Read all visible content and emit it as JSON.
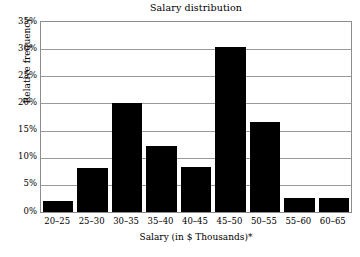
{
  "chart_data": {
    "type": "bar",
    "title": "Salary distribution",
    "xlabel": "Salary (in $ Thousands)*",
    "ylabel": "Relative frequency",
    "categories": [
      "20–25",
      "25–30",
      "30–35",
      "35–40",
      "40–45",
      "45–50",
      "50–55",
      "55–60",
      "60–65"
    ],
    "values": [
      2.1,
      8.1,
      20.1,
      12.2,
      8.3,
      30.4,
      16.5,
      2.5,
      2.6
    ],
    "ylim": [
      0,
      35
    ],
    "y_ticks": [
      0,
      5,
      10,
      15,
      20,
      25,
      30,
      35
    ],
    "y_tick_labels": [
      "0%",
      "5%",
      "10%",
      "15%",
      "20%",
      "25%",
      "30%",
      "35%"
    ],
    "grid": "horizontal",
    "legend": "none",
    "bar_color": "#000000",
    "grid_color": "#9a9a9a",
    "axis_color": "#8c8c8c",
    "background_color": "#ffffff"
  }
}
